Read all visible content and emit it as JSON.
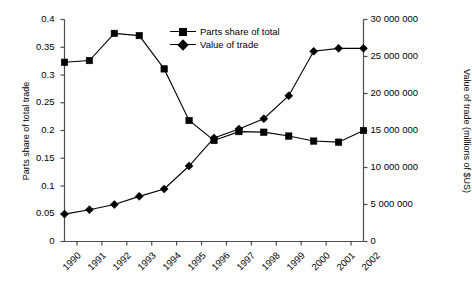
{
  "chart_data": {
    "type": "line",
    "title": "",
    "xlabel": "",
    "ylabel": "Parts share of total trade",
    "y2label": "Value of trade (millions of $US)",
    "categories": [
      "1990",
      "1991",
      "1992",
      "1993",
      "1994",
      "1995",
      "1996",
      "1997",
      "1998",
      "1999",
      "2000",
      "2001",
      "2002"
    ],
    "ylim": [
      0,
      0.4
    ],
    "y2lim": [
      0,
      30000000
    ],
    "yticks": [
      0,
      0.05,
      0.1,
      0.15,
      0.2,
      0.25,
      0.3,
      0.35,
      0.4
    ],
    "ytick_labels": [
      "0",
      "0.05",
      "0.1",
      "0.15",
      "0.2",
      "0.25",
      "0.3",
      "0.35",
      "0.4"
    ],
    "y2ticks": [
      0,
      5000000,
      10000000,
      15000000,
      20000000,
      25000000,
      30000000
    ],
    "y2tick_labels": [
      "0",
      "5 000 000",
      "10 000 000",
      "15 000 000",
      "20 000 000",
      "25 000 000",
      "30 000 000"
    ],
    "grid": false,
    "legend_position": "upper-center",
    "series": [
      {
        "name": "Parts share of total",
        "axis": "left",
        "marker": "square",
        "color": "#000000",
        "values": [
          0.323,
          0.326,
          0.375,
          0.371,
          0.311,
          0.218,
          0.182,
          0.198,
          0.197,
          0.19,
          0.181,
          0.179,
          0.2
        ]
      },
      {
        "name": "Value of trade",
        "axis": "right",
        "marker": "diamond",
        "color": "#000000",
        "values": [
          3700000,
          4300000,
          5000000,
          6100000,
          7100000,
          10200000,
          14000000,
          15200000,
          16600000,
          19700000,
          25700000,
          26100000,
          26100000
        ]
      }
    ]
  },
  "legend": {
    "items": [
      {
        "label": "Parts share of total",
        "marker": "square"
      },
      {
        "label": "Value of trade",
        "marker": "diamond"
      }
    ]
  }
}
